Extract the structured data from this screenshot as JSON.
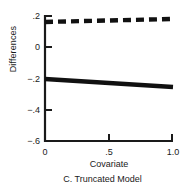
{
  "chart_data": {
    "type": "line",
    "title": "",
    "caption": "C. Truncated Model",
    "xlabel": "Covariate",
    "ylabel": "Differences",
    "xlim": [
      0,
      1.0
    ],
    "ylim": [
      -0.6,
      0.2
    ],
    "xticks": [
      0,
      0.5,
      1.0
    ],
    "xticklabels": [
      "0",
      ".5",
      "1.0"
    ],
    "yticks": [
      0.2,
      0,
      -0.2,
      -0.4,
      -0.6
    ],
    "yticklabels": [
      ".2",
      "0",
      "−.2",
      "−.4",
      "−.6"
    ],
    "grid": false,
    "legend": "none",
    "series": [
      {
        "name": "dashed-upper",
        "style": "dashed",
        "color": "#111111",
        "linewidth": 4,
        "x": [
          0,
          1.0
        ],
        "values": [
          0.162,
          0.181
        ]
      },
      {
        "name": "solid-lower",
        "style": "solid",
        "color": "#111111",
        "linewidth": 4,
        "x": [
          0,
          1.0
        ],
        "values": [
          -0.203,
          -0.254
        ]
      }
    ]
  },
  "axes": {
    "spine_color": "#1a1a1a",
    "background": "#ffffff"
  }
}
